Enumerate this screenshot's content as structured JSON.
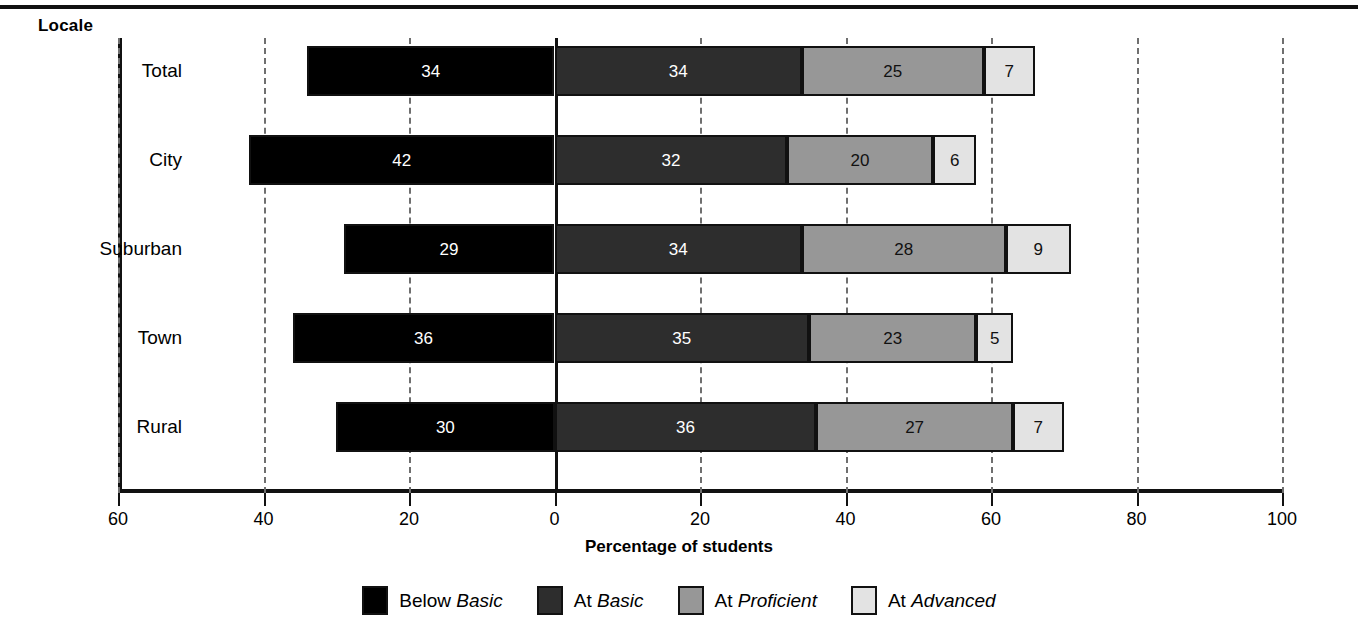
{
  "header": {
    "group_label": "Locale"
  },
  "chart_data": {
    "type": "bar",
    "orientation": "horizontal",
    "stacked": true,
    "diverging": true,
    "title": "",
    "xlabel": "Percentage of students",
    "ylabel": "Locale",
    "categories": [
      "Total",
      "City",
      "Suburban",
      "Town",
      "Rural"
    ],
    "series": [
      {
        "name": "Below Basic",
        "name_plain": "Below",
        "name_italic": "Basic",
        "color": "#000000",
        "values": [
          34,
          42,
          29,
          36,
          30
        ]
      },
      {
        "name": "At Basic",
        "name_plain": "At",
        "name_italic": "Basic",
        "color": "#2d2d2d",
        "values": [
          34,
          32,
          34,
          35,
          36
        ]
      },
      {
        "name": "At Proficient",
        "name_plain": "At",
        "name_italic": "Proficient",
        "color": "#979797",
        "values": [
          25,
          20,
          28,
          23,
          27
        ]
      },
      {
        "name": "At Advanced",
        "name_plain": "At",
        "name_italic": "Advanced",
        "color": "#e3e3e3",
        "values": [
          7,
          6,
          9,
          5,
          7
        ]
      }
    ],
    "xlim": [
      -60,
      100
    ],
    "xticks": [
      -60,
      -40,
      -20,
      0,
      20,
      40,
      60,
      80,
      100
    ],
    "xtick_labels": [
      "60",
      "40",
      "20",
      "0",
      "20",
      "40",
      "60",
      "80",
      "100"
    ],
    "grid": true,
    "grid_style": "dashed",
    "zero_line": true,
    "legend_position": "bottom",
    "note": "Bars diverge from 0: 'Below Basic' extends left of zero; 'At Basic', 'At Proficient', 'At Advanced' stack to the right."
  }
}
